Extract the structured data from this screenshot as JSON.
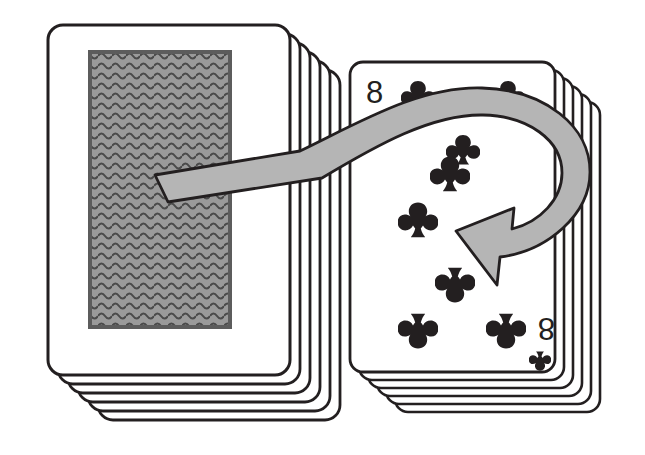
{
  "illustration": {
    "title": "Playing card deck with turn-over arrow",
    "background_color": "#ffffff",
    "ink_color": "#231f20",
    "arrow_fill_color": "#b5b5b5",
    "card_back_gray": "#9a9a9a",
    "card_face_color": "#ffffff"
  },
  "left_deck": {
    "name": "face-down deck",
    "orientation": "face-down",
    "card_count_visible": 6,
    "back_pattern": "horizontal wavy lines",
    "top_card": {
      "x": 48,
      "y": 25,
      "width": 242,
      "height": 350
    },
    "back_panel": {
      "x": 90,
      "y": 52,
      "width": 140,
      "height": 275
    },
    "stack_offset_x": 10,
    "stack_offset_y": 9
  },
  "right_deck": {
    "name": "face-up deck",
    "orientation": "face-up",
    "card_count_visible": 6,
    "top_card": {
      "x": 350,
      "y": 62,
      "width": 205,
      "height": 310
    },
    "stack_offset_x": 9,
    "stack_offset_y": 8,
    "face_card": {
      "rank": "8",
      "suit": "clubs",
      "suit_symbol": "♣",
      "corner_index_top_left": "8",
      "corner_index_bottom_right": "8",
      "pip_count": 8,
      "pips": [
        {
          "x": 418,
          "y": 96,
          "size": 34,
          "rotated": false,
          "occluded": true
        },
        {
          "x": 508,
          "y": 96,
          "size": 34,
          "rotated": false,
          "occluded": true
        },
        {
          "x": 463,
          "y": 150,
          "size": 34,
          "rotated": false,
          "occluded": true
        },
        {
          "x": 450,
          "y": 174,
          "size": 40,
          "rotated": false,
          "occluded": false
        },
        {
          "x": 418,
          "y": 220,
          "size": 40,
          "rotated": false,
          "occluded": false
        },
        {
          "x": 455,
          "y": 285,
          "size": 40,
          "rotated": true,
          "occluded": false
        },
        {
          "x": 418,
          "y": 331,
          "size": 40,
          "rotated": true,
          "occluded": false
        },
        {
          "x": 506,
          "y": 331,
          "size": 40,
          "rotated": true,
          "occluded": false
        }
      ],
      "corner_pip_bottom_right": {
        "x": 549,
        "y": 327,
        "size": 22,
        "rotated": true
      }
    }
  },
  "arrow": {
    "name": "flip-over arrow",
    "description": "curved arrow sweeping from the face-down deck rightward, looping around and pointing back left",
    "fill": "#b5b5b5",
    "stroke": "#231f20",
    "tail_point": {
      "x": 155,
      "y": 175
    },
    "head_point": {
      "x": 456,
      "y": 231
    },
    "direction": "left",
    "loop": "clockwise"
  }
}
